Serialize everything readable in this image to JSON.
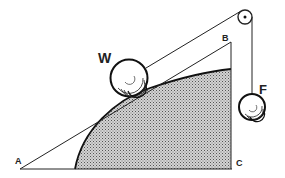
{
  "diagram": {
    "type": "physics-incline-with-pulley",
    "labels": {
      "A": "A",
      "B": "B",
      "C": "C",
      "W": "W",
      "F": "F"
    },
    "colors": {
      "line": "#222222",
      "fill_hatch": "#9a9a9a",
      "background": "#ffffff"
    }
  }
}
